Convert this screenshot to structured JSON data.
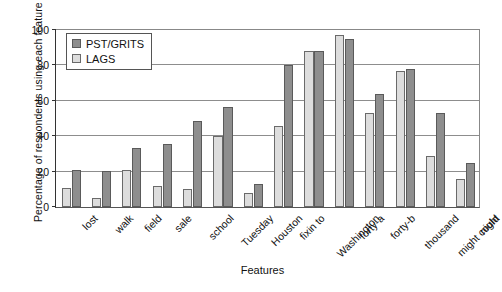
{
  "chart_data": {
    "type": "bar",
    "title": "",
    "xlabel": "Features",
    "ylabel": "Percentage of respondents using each feature",
    "ylim": [
      0,
      100
    ],
    "ytick_labels": [
      "0",
      "20",
      "40",
      "60",
      "80",
      "100"
    ],
    "ytick_values": [
      0,
      20,
      40,
      60,
      80,
      100
    ],
    "grid": true,
    "legend_position": "upper left",
    "categories": [
      "lost",
      "walk",
      "field",
      "sale",
      "school",
      "Tuesday",
      "Houston",
      "fixin to",
      "Washington",
      "forty-a",
      "forty-b",
      "thousand",
      "might could",
      "night"
    ],
    "series": [
      {
        "name": "LAGS",
        "color": "#dddddd",
        "values": [
          11,
          5,
          21,
          12,
          10,
          40,
          8,
          46,
          88,
          97,
          53,
          77,
          29,
          16
        ]
      },
      {
        "name": "PST/GRITS",
        "color": "#8e8e8e",
        "values": [
          21,
          20.5,
          33.5,
          35.5,
          48.5,
          56.5,
          13,
          80,
          88,
          95,
          64,
          78,
          53,
          25
        ]
      }
    ]
  },
  "legend": {
    "entries": [
      {
        "label": "PST/GRITS",
        "swatch": "pst"
      },
      {
        "label": "LAGS",
        "swatch": "lags"
      }
    ]
  }
}
